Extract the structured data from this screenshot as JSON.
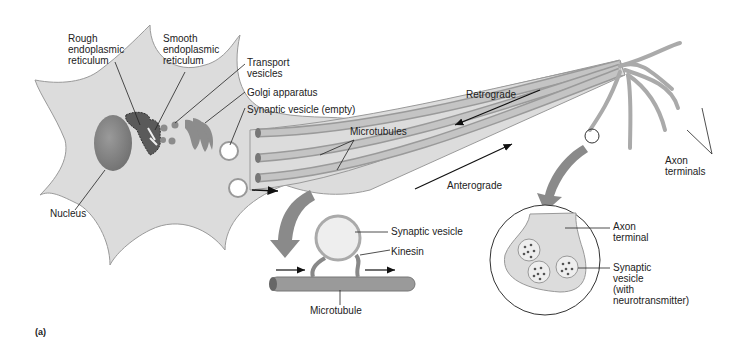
{
  "figure": {
    "panel_label": "(a)",
    "labels": {
      "rough_er": [
        "Rough",
        "endoplasmic",
        "reticulum"
      ],
      "smooth_er": [
        "Smooth",
        "endoplasmic",
        "reticulum"
      ],
      "transport_vesicles": [
        "Transport",
        "vesicles"
      ],
      "golgi": "Golgi apparatus",
      "synaptic_vesicle_empty": "Synaptic vesicle (empty)",
      "microtubules": "Microtubules",
      "nucleus": "Nucleus",
      "retrograde": "Retrograde",
      "anterograde": "Anterograde",
      "axon_terminals": [
        "Axon",
        "terminals"
      ],
      "synaptic_vesicle": "Synaptic vesicle",
      "kinesin": "Kinesin",
      "microtubule": "Microtubule",
      "axon_terminal": [
        "Axon",
        "terminal"
      ],
      "synaptic_vesicle_nt": [
        "Synaptic",
        "vesicle",
        "(with",
        "neurotransmitter)"
      ]
    },
    "colors": {
      "cell_fill": "#dcdcdc",
      "cell_stroke": "#9a9a9a",
      "organelle_dark": "#5a5a5a",
      "organelle_mid": "#8c8c8c",
      "arrow_gray": "#8a8a8a",
      "text": "#222222"
    }
  }
}
